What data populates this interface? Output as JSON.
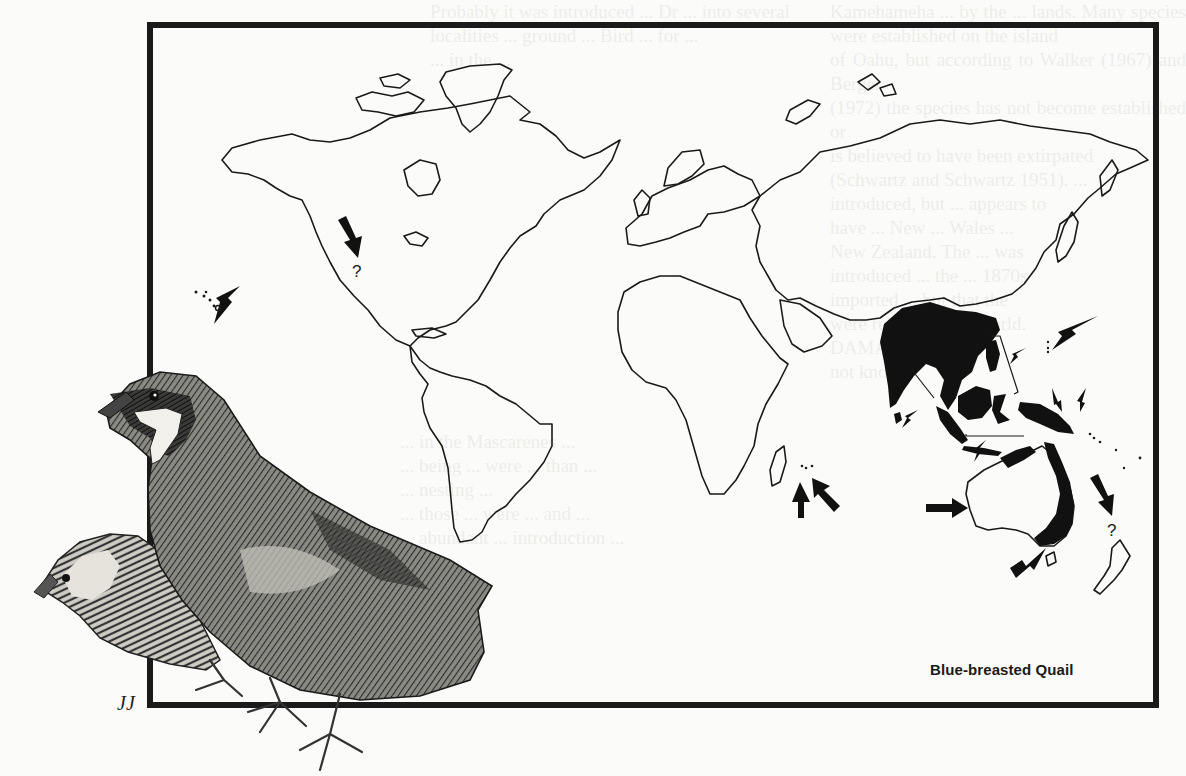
{
  "page": {
    "type": "scanned-book-page",
    "background_color": "#fbfbf9",
    "ink_color": "#1a1a1a"
  },
  "figure": {
    "caption": "Blue-breasted Quail",
    "artist_signature": "JJ",
    "map": {
      "projection": "world outline map",
      "native_range_fill": "#111111",
      "native_range_regions": [
        "Indian subcontinent",
        "Sri Lanka",
        "Southern China and Indochina",
        "Malay Peninsula",
        "Sumatra",
        "Java",
        "Borneo",
        "Philippines",
        "Sulawesi",
        "New Guinea",
        "Bismarck Archipelago",
        "Northern and eastern Australia"
      ],
      "introduction_markers": [
        {
          "location": "Hawaiian Islands",
          "arrow": true,
          "question": false
        },
        {
          "location": "Western North America",
          "arrow": true,
          "question": true
        },
        {
          "location": "Reunion",
          "arrow": true,
          "question": false
        },
        {
          "location": "Mauritius",
          "arrow": true,
          "question": false
        },
        {
          "location": "Guam / Mariana Islands",
          "arrow": true,
          "question": false
        },
        {
          "location": "Southwestern Australia",
          "arrow": true,
          "question": false
        },
        {
          "location": "Tasmania / Southeastern Australia",
          "arrow": true,
          "question": false
        },
        {
          "location": "New Zealand",
          "arrow": true,
          "question": true
        }
      ],
      "question_mark": "?"
    },
    "illustration": {
      "subject": "Pair of Blue-breasted Quails (male and female)",
      "style": "pen-and-ink stipple"
    }
  },
  "bleed_through": {
    "right": "Kamehameha ... by the ... lands. Many species were established on the island\nof Oahu, but according to Walker (1967) and Berger\n(1972) the species has not become established or\nis believed to have been extirpated\n(Schwartz and Schwartz 1951). ...\nintroduced, but ... appears to\nhave ... New ... Wales ...\nNew Zealand. The ... was\nintroduced ... the ... 1870s\nimported ... but that the\nwere released in ... world.\nDAMAGE\nnot known",
    "middle": "Probably it was introduced ... Dr ... into several\nlocalities ... ground ... Bird ... for ...\n... in the ...",
    "lower": "... in the Mascarenes ...\n... being ... were ... than ...\n... nesting ...\n... those ... were ... and ...\n... abundant ... introduction ..."
  }
}
